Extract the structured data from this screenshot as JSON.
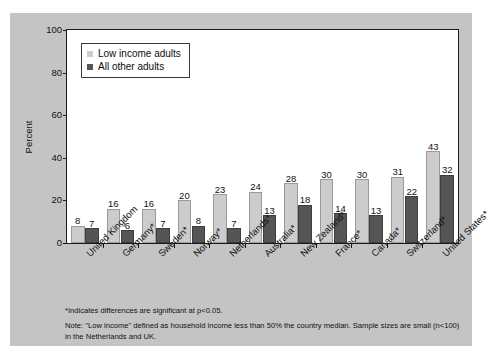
{
  "chart_data": {
    "type": "bar",
    "title": "",
    "xlabel": "",
    "ylabel": "Percent",
    "ylim": [
      0,
      100
    ],
    "yticks": [
      0,
      20,
      40,
      60,
      80,
      100
    ],
    "grid": false,
    "legend_position": "top-left",
    "categories": [
      "United Kingdom",
      "Germany*",
      "Sweden*",
      "Norway*",
      "Netherlands*",
      "Australia*",
      "New Zealand*",
      "France*",
      "Canada*",
      "Switzerland*",
      "United States*"
    ],
    "series": [
      {
        "name": "Low income adults",
        "color": "#cccccc",
        "values": [
          8,
          16,
          16,
          20,
          23,
          24,
          28,
          30,
          30,
          31,
          43
        ]
      },
      {
        "name": "All other adults",
        "color": "#555555",
        "values": [
          7,
          6,
          7,
          8,
          7,
          13,
          18,
          14,
          13,
          22,
          32
        ]
      }
    ],
    "annotations": [
      "*Indicates differences are significant at p<0.05.",
      "Note: \"Low income\" defined as household income less than 50% the country median. Sample sizes are small (n<100) in the Netherlands and UK."
    ]
  },
  "axis": {
    "ylabel": "Percent",
    "ytick_labels": [
      "0",
      "20",
      "40",
      "60",
      "80",
      "100"
    ]
  },
  "legend": {
    "items": [
      {
        "label": "Low income adults",
        "color": "#cccccc"
      },
      {
        "label": "All other adults",
        "color": "#555555"
      }
    ]
  },
  "notes": {
    "significance": "*Indicates differences are significant at p<0.05.",
    "definition": "Note: \"Low income\" defined as household income less than 50% the country median. Sample sizes are small (n<100) in the Netherlands and UK."
  },
  "page": {
    "bleed_text": ""
  },
  "colors": {
    "panel_background": "#c4c4c4",
    "plot_background": "#ffffff",
    "axis": "#1a1a1a",
    "light_series": "#cccccc",
    "dark_series": "#555555"
  }
}
